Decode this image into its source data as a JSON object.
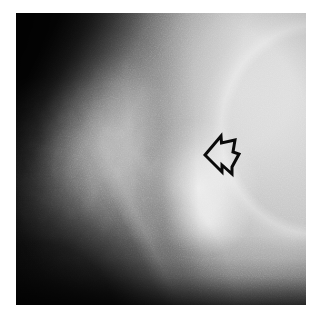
{
  "image": {
    "kind": "radiograph",
    "modality_label": "X-ray",
    "body_region_label": "hip joint (proximal femur)",
    "view_label": "lateral / oblique projection",
    "color_mode": "grayscale",
    "canvas": {
      "width_px": 322,
      "height_px": 320,
      "background_color": "#ffffff"
    },
    "plate": {
      "left_px": 16,
      "top_px": 13,
      "width_px": 290,
      "height_px": 292,
      "border_color": "#ffffff"
    },
    "tones": {
      "darkest": "#0c0c0c",
      "dark": "#2e2e2e",
      "midtone": "#8f8f8f",
      "light": "#dedede",
      "brightest": "#fdfdfd"
    },
    "regions": [
      {
        "name": "soft-tissue-shadow-upper-left",
        "description": "dense black diagonal band along the upper-left corner"
      },
      {
        "name": "trochanteric-bone-mass",
        "description": "mottled mid-grey bone with trabecular texture, left of centre"
      },
      {
        "name": "joint-space",
        "description": "narrow darker band separating the bone mass from the articular head"
      },
      {
        "name": "articular-head",
        "description": "rounded bright structure right of centre"
      },
      {
        "name": "acetabular-roof",
        "description": "very bright field sweeping across the upper right"
      },
      {
        "name": "femoral-shaft",
        "description": "bright cortical lines running diagonally to the lower left"
      },
      {
        "name": "background-dark-lower-left",
        "description": "black unexposed field at the lower-left and bottom"
      }
    ]
  },
  "annotations": {
    "arrow": {
      "icon_name": "outline-arrow-icon",
      "shape": "open outlined block arrow",
      "direction": "left",
      "stroke_color": "#0a0a0a",
      "fill_color": "none",
      "stroke_width_px": 3,
      "left_px": 186,
      "top_px": 114,
      "width_px": 42,
      "height_px": 54,
      "points_at_region": "joint-space",
      "caption": ""
    }
  }
}
